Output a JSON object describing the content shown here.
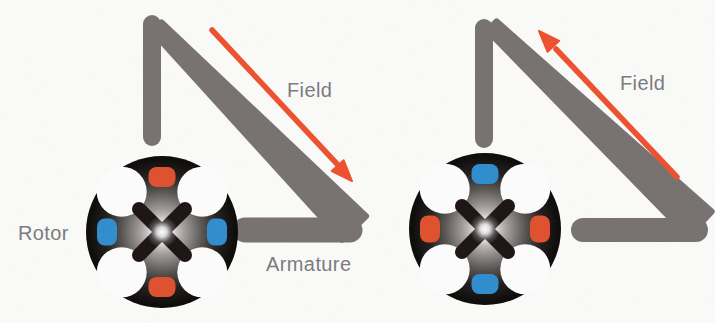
{
  "units": [
    {
      "id": "left-machine",
      "field_label": "Field",
      "rotor_label": "Rotor",
      "armature_label": "Armature",
      "field_arrow_direction": "down-right",
      "poles": {
        "top": "#df4f2c",
        "right": "#2e8ccd",
        "bottom": "#df4f2c",
        "left": "#2e8ccd"
      }
    },
    {
      "id": "right-machine",
      "field_label": "Field",
      "field_arrow_direction": "up-left",
      "poles": {
        "top": "#2e8ccd",
        "right": "#df4f2c",
        "bottom": "#2e8ccd",
        "left": "#df4f2c"
      }
    }
  ],
  "colors": {
    "background": "#fbfbf9",
    "bar-gray": "#767170",
    "arrow-orange": "#ee4f2d",
    "pole-red": "#df4f2c",
    "pole-blue": "#2e8ccd",
    "label-gray": "#7c7b80",
    "rotor-black": "#0b0808",
    "rotor-cross": "#1a1113"
  }
}
